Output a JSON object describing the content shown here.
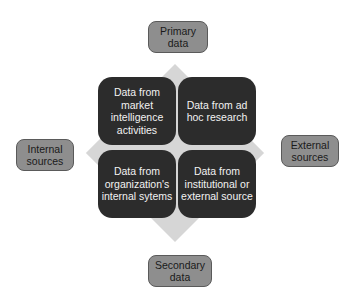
{
  "diagram": {
    "axis_labels": {
      "top": "Primary data",
      "bottom": "Secondary data",
      "left": "Internal sources",
      "right": "External sources"
    },
    "quadrants": [
      {
        "position": "top-left",
        "text": "Data from market intelligence activities"
      },
      {
        "position": "top-right",
        "text": "Data from ad hoc research"
      },
      {
        "position": "bottom-left",
        "text": "Data from organization's internal sytems"
      },
      {
        "position": "bottom-right",
        "text": "Data from institutional or external source"
      }
    ],
    "colors": {
      "quadrant_fill": "#2c2c2c",
      "quadrant_text": "#f2f2f2",
      "label_fill": "#8e8e8e",
      "diamond_fill": "#d6d6d6"
    }
  }
}
